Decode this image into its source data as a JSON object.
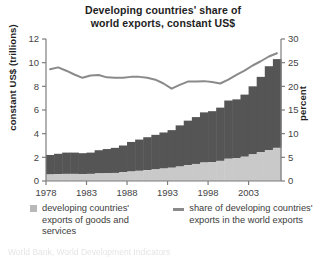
{
  "chart_data": {
    "type": "bar",
    "title": "Developing countries' share of world exports, constant US$",
    "title_line1": "Developing countries' share of",
    "title_line2": "world exports, constant US$",
    "xlabel": "",
    "ylabel": "constant US$ (trillions)",
    "ylabel_right": "percent",
    "ylim": [
      0,
      12
    ],
    "ylim_right": [
      0,
      30
    ],
    "yticks": [
      0,
      2,
      4,
      6,
      8,
      10,
      12
    ],
    "yticks_right": [
      0,
      5,
      10,
      15,
      20,
      25,
      30
    ],
    "xticks": [
      1978,
      1983,
      1988,
      1993,
      1998,
      2003
    ],
    "xlim": [
      1977.5,
      2006.5
    ],
    "grid": false,
    "legend_position": "bottom",
    "stacked": true,
    "x": [
      1978,
      1979,
      1980,
      1981,
      1982,
      1983,
      1984,
      1985,
      1986,
      1987,
      1988,
      1989,
      1990,
      1991,
      1992,
      1993,
      1994,
      1995,
      1996,
      1997,
      1998,
      1999,
      2000,
      2001,
      2002,
      2003,
      2004,
      2005,
      2006
    ],
    "series": [
      {
        "name": "developing countries' exports of goods and services",
        "type": "bar",
        "axis": "left",
        "unit": "trillions constant US$",
        "color": "#c9c9c9",
        "values": [
          0.55,
          0.58,
          0.6,
          0.6,
          0.58,
          0.6,
          0.64,
          0.65,
          0.68,
          0.74,
          0.8,
          0.86,
          0.92,
          0.98,
          1.05,
          1.12,
          1.22,
          1.34,
          1.44,
          1.56,
          1.6,
          1.7,
          1.88,
          1.92,
          2.05,
          2.25,
          2.45,
          2.62,
          2.8
        ]
      },
      {
        "name": "developed countries' exports (upper stack segment)",
        "type": "bar",
        "axis": "left",
        "unit": "trillions constant US$",
        "color": "#555555",
        "values": [
          1.65,
          1.72,
          1.8,
          1.8,
          1.77,
          1.8,
          1.96,
          2.05,
          2.12,
          2.26,
          2.5,
          2.64,
          2.78,
          2.92,
          3.05,
          3.18,
          3.48,
          3.76,
          3.96,
          4.24,
          4.3,
          4.5,
          4.92,
          4.98,
          5.25,
          5.75,
          6.35,
          7.08,
          7.5
        ]
      },
      {
        "name": "total exports of goods and services",
        "type": "bar-total",
        "axis": "left",
        "unit": "trillions constant US$",
        "values": [
          2.2,
          2.3,
          2.4,
          2.4,
          2.35,
          2.4,
          2.6,
          2.7,
          2.8,
          3.0,
          3.3,
          3.5,
          3.7,
          3.9,
          4.1,
          4.3,
          4.7,
          5.1,
          5.4,
          5.8,
          5.9,
          6.2,
          6.8,
          6.9,
          7.3,
          8.0,
          8.8,
          9.7,
          10.3
        ]
      },
      {
        "name": "share of developing countries' exports in the world exports",
        "type": "line",
        "axis": "right",
        "unit": "percent",
        "color": "#8a8a8a",
        "values": [
          23.6,
          24.0,
          23.3,
          22.5,
          21.8,
          22.3,
          22.4,
          21.9,
          21.8,
          21.8,
          22.0,
          22.0,
          21.8,
          21.4,
          20.6,
          19.5,
          20.3,
          21.0,
          21.0,
          21.1,
          20.9,
          20.6,
          21.4,
          22.4,
          23.3,
          24.4,
          25.3,
          26.3,
          27.0
        ]
      }
    ],
    "legend": [
      {
        "key": "swatch",
        "color": "#c9c9c9",
        "label": "developing countries' exports of goods and services"
      },
      {
        "key": "line",
        "color": "#8a8a8a",
        "label": "share of developing countries' exports in the world exports"
      }
    ]
  },
  "footer": {
    "text": "World Bank, World Development Indicators"
  }
}
